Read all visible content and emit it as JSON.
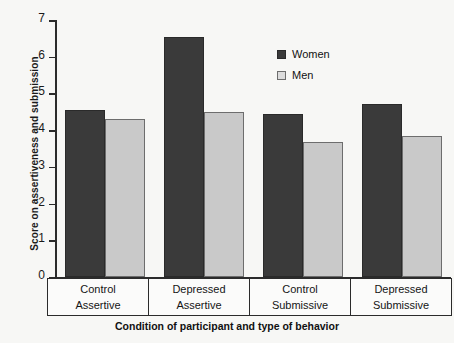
{
  "chart_data": {
    "type": "bar",
    "title": "",
    "xlabel": "Condition of participant and type of behavior",
    "ylabel": "Score on assertiveness and submission",
    "ylim": [
      0,
      7
    ],
    "ytick_labels": [
      "0",
      "1",
      "2",
      "3",
      "4",
      "5",
      "6",
      "7"
    ],
    "grid": false,
    "legend_position": "upper-center-right",
    "categories": [
      "Control Assertive",
      "Depressed Assertive",
      "Control Submissive",
      "Depressed Submissive"
    ],
    "category_rows": [
      {
        "condition": "Control",
        "behavior": "Assertive"
      },
      {
        "condition": "Depressed",
        "behavior": "Assertive"
      },
      {
        "condition": "Control",
        "behavior": "Submissive"
      },
      {
        "condition": "Depressed",
        "behavior": "Submissive"
      }
    ],
    "series": [
      {
        "name": "Women",
        "color": "#3a3a3a",
        "values": [
          4.55,
          6.55,
          4.45,
          4.7
        ]
      },
      {
        "name": "Men",
        "color": "#c9c9c9",
        "values": [
          4.3,
          4.5,
          3.68,
          3.83
        ]
      }
    ]
  }
}
